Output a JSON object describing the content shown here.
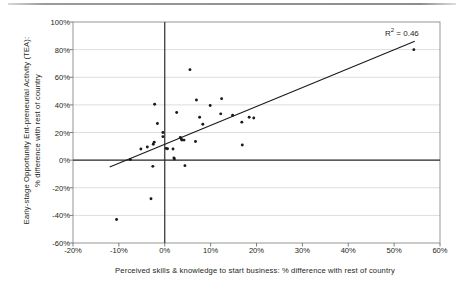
{
  "figure": {
    "annotation_r2_label": "R",
    "annotation_r2_exp": "2",
    "annotation_r2_value": " = 0.46"
  },
  "chart_data": {
    "type": "scatter",
    "title": "",
    "xlabel": "Perceived skills & knowledge to start business: % difference with rest of country",
    "ylabel": "Early-stage Opportunity Ent-preneurial Activity (TEA):\n% difference with rest of country",
    "xlim": [
      -20,
      60
    ],
    "ylim": [
      -60,
      100
    ],
    "xticks": [
      "-20%",
      "-10%",
      "0%",
      "10%",
      "20%",
      "30%",
      "40%",
      "50%",
      "60%"
    ],
    "xtick_values": [
      -20,
      -10,
      0,
      10,
      20,
      30,
      40,
      50,
      60
    ],
    "yticks": [
      "100%",
      "80%",
      "60%",
      "40%",
      "20%",
      "0%",
      "-20%",
      "-40%",
      "-60%"
    ],
    "ytick_values": [
      100,
      80,
      60,
      40,
      20,
      0,
      -20,
      -40,
      -60
    ],
    "grid": "horizontal",
    "legend": "none",
    "annotations": [
      {
        "text": "R2 = 0.46",
        "x": 47,
        "y": 92
      }
    ],
    "axis_lines": {
      "zero_horizontal": 0,
      "zero_vertical": 0
    },
    "trendline": {
      "type": "linear",
      "x_start": -12.0,
      "y_start": -5.0,
      "x_end": 54.5,
      "y_end": 86.0,
      "r_squared": 0.46
    },
    "points": [
      {
        "x": -10.5,
        "y": -43.0
      },
      {
        "x": -3.0,
        "y": -28.0
      },
      {
        "x": -2.6,
        "y": -4.5
      },
      {
        "x": -2.2,
        "y": 40.5
      },
      {
        "x": -2.3,
        "y": 13.0
      },
      {
        "x": -2.5,
        "y": 11.5
      },
      {
        "x": -1.6,
        "y": 26.5
      },
      {
        "x": -0.4,
        "y": 20.0
      },
      {
        "x": -0.4,
        "y": 17.0
      },
      {
        "x": -3.8,
        "y": 9.5
      },
      {
        "x": -5.2,
        "y": 8.0
      },
      {
        "x": -7.5,
        "y": 0.5
      },
      {
        "x": 0.3,
        "y": 8.5
      },
      {
        "x": 0.6,
        "y": 8.2
      },
      {
        "x": 1.8,
        "y": 8.0
      },
      {
        "x": 2.0,
        "y": 1.5
      },
      {
        "x": 2.1,
        "y": 0.8
      },
      {
        "x": 2.6,
        "y": 34.5
      },
      {
        "x": 3.4,
        "y": 16.5
      },
      {
        "x": 3.6,
        "y": 15.5
      },
      {
        "x": 3.7,
        "y": 14.5
      },
      {
        "x": 4.2,
        "y": 14.5
      },
      {
        "x": 4.4,
        "y": -4.0
      },
      {
        "x": 5.5,
        "y": 65.5
      },
      {
        "x": 6.9,
        "y": 43.5
      },
      {
        "x": 6.7,
        "y": 13.5
      },
      {
        "x": 7.6,
        "y": 31.0
      },
      {
        "x": 8.3,
        "y": 26.0
      },
      {
        "x": 9.9,
        "y": 39.5
      },
      {
        "x": 12.4,
        "y": 44.5
      },
      {
        "x": 12.2,
        "y": 33.5
      },
      {
        "x": 14.8,
        "y": 32.5
      },
      {
        "x": 16.8,
        "y": 27.5
      },
      {
        "x": 16.9,
        "y": 11.0
      },
      {
        "x": 18.4,
        "y": 31.0
      },
      {
        "x": 19.4,
        "y": 30.5
      },
      {
        "x": 54.3,
        "y": 80.0
      }
    ]
  }
}
